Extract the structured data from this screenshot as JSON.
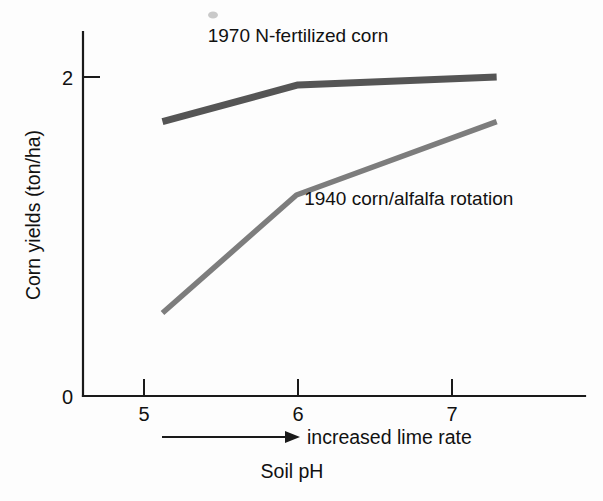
{
  "chart_data": {
    "type": "line",
    "title": "",
    "subtitle": "",
    "xlabel": "Soil pH",
    "ylabel": "Corn yields (ton/ha)",
    "x_axis_annotation": "increased lime rate",
    "x_ticks": [
      "5",
      "6",
      "7"
    ],
    "x_tick_values": [
      5,
      6,
      7
    ],
    "y_ticks": [
      "0",
      "2"
    ],
    "y_tick_values": [
      0,
      2
    ],
    "xlim": [
      4.6,
      7.4
    ],
    "ylim": [
      0,
      2.3
    ],
    "grid": false,
    "legend": "inline-labels",
    "series": [
      {
        "name": "1970 N-fertilized corn",
        "color": "#555555",
        "x": [
          5.12,
          6.0,
          7.29
        ],
        "values": [
          1.72,
          1.95,
          2.0
        ],
        "label_x": 6.0,
        "label_y": 2.22
      },
      {
        "name": "1940 corn/alfalfa rotation",
        "color": "#7d7d7d",
        "x": [
          5.12,
          5.99,
          7.29
        ],
        "values": [
          0.52,
          1.26,
          1.72
        ],
        "label_x": 6.04,
        "label_y": 1.2
      }
    ]
  },
  "figure": {
    "y_axis_label": "Corn yields (ton/ha)",
    "x_axis_label": "Soil pH",
    "lime_rate_label": "increased lime rate",
    "series_label_upper": "1970 N-fertilized corn",
    "series_label_lower": "1940 corn/alfalfa rotation",
    "y_tick_0": "0",
    "y_tick_2": "2",
    "x_tick_5": "5",
    "x_tick_6": "6",
    "x_tick_7": "7"
  }
}
